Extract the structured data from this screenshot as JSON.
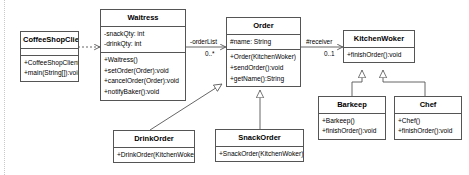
{
  "diagram": {
    "type": "uml-class-diagram",
    "background": "#ffffff",
    "line_color": "#555555"
  },
  "classes": {
    "coffeeShopClient": {
      "name": "CoffeeShopClient",
      "attributes": [],
      "operations": [
        "+CoffeeShopClient()",
        "+main(String[]):void"
      ]
    },
    "waitress": {
      "name": "Waitress",
      "attributes": [
        "-snackQty: int",
        "-drinkQty: int"
      ],
      "operations": [
        "+Waitress()",
        "+setOrder(Order):void",
        "+cancelOrder(Order):void",
        "+notifyBaker():void"
      ]
    },
    "order": {
      "name": "Order",
      "attributes": [
        "#name: String"
      ],
      "operations": [
        "+Order(KitchenWoker)",
        "+sendOrder():void",
        "+getName():String"
      ]
    },
    "kitchenWorker": {
      "name": "KitchenWoker",
      "attributes": [],
      "operations": [
        "+finishOrder():void"
      ]
    },
    "drinkOrder": {
      "name": "DrinkOrder",
      "attributes": [],
      "operations": [
        "+DrinkOrder(KitchenWoker)"
      ]
    },
    "snackOrder": {
      "name": "SnackOrder",
      "attributes": [],
      "operations": [
        "+SnackOrder(KitchenWoker)"
      ]
    },
    "barkeep": {
      "name": "Barkeep",
      "attributes": [],
      "operations": [
        "+Barkeep()",
        "+finishOrder():void"
      ]
    },
    "chef": {
      "name": "Chef",
      "attributes": [],
      "operations": [
        "+Chef()",
        "+finishOrder():void"
      ]
    }
  },
  "relationships": {
    "waitress_order": {
      "role": "-orderList",
      "multiplicity": "0..*",
      "kind": "association"
    },
    "order_kitchenworker": {
      "role": "#receiver",
      "multiplicity": "0..1",
      "kind": "association"
    },
    "client_waitress": {
      "kind": "dependency"
    },
    "drinkorder_order": {
      "kind": "generalization"
    },
    "snackorder_order": {
      "kind": "generalization"
    },
    "barkeep_kitchenworker": {
      "kind": "generalization"
    },
    "chef_kitchenworker": {
      "kind": "generalization"
    }
  }
}
